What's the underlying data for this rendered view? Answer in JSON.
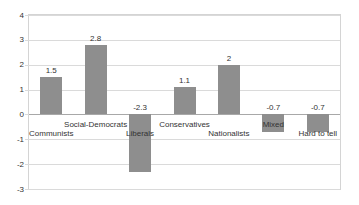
{
  "chart_data": {
    "type": "bar",
    "categories": [
      "Communists",
      "Social-Democrats",
      "Liberals",
      "Conservatives",
      "Nationalists",
      "Mixed",
      "Hard to tell"
    ],
    "values": [
      1.5,
      2.8,
      -2.3,
      1.1,
      2,
      -0.7,
      -0.7
    ],
    "title": "",
    "xlabel": "",
    "ylabel": "",
    "ylim": [
      -3,
      4
    ],
    "yticks": [
      4,
      3,
      2,
      1,
      0,
      -1,
      -2,
      -3
    ],
    "grid": true,
    "legend": "none",
    "data_labels": true,
    "label_rows": "staggered",
    "colors": {
      "bar": "#8e8e8e",
      "gridline": "#dadada",
      "zero_axis": "#a8a8a8",
      "plot_border": "#d4d4d4",
      "text": "#333333",
      "background": "#ffffff"
    }
  }
}
